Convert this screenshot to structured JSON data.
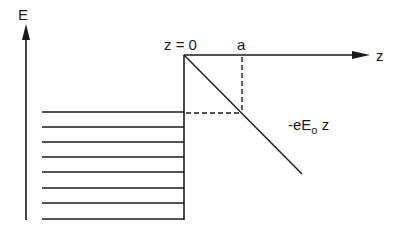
{
  "diagram": {
    "type": "energy-band-diagram",
    "labels": {
      "energy_axis": "E",
      "position_axis": "z",
      "origin": "z = 0",
      "width_marker": "a",
      "potential_prefix": "-eE",
      "potential_subscript": "o",
      "potential_suffix": " z"
    },
    "colors": {
      "line": "#1a1a1a",
      "background": "#ffffff"
    },
    "geometry": {
      "energy_axis": {
        "x": 26,
        "y_top": 24,
        "y_bottom": 220
      },
      "z_axis": {
        "x_start": 184,
        "x_end": 370,
        "y": 55
      },
      "wall": {
        "x": 184,
        "y_top": 55,
        "y_bottom": 220
      },
      "slope_line": {
        "x1": 184,
        "y1": 55,
        "x2": 302,
        "y2": 174
      },
      "dashed_vertical": {
        "x": 242,
        "y1": 55,
        "y2": 113
      },
      "dashed_horizontal": {
        "x1": 184,
        "x2": 242,
        "y": 113
      },
      "filled_levels": {
        "x_start": 42,
        "x_end": 184,
        "y": [
          112,
          127,
          142,
          157,
          172,
          188,
          203,
          219
        ]
      }
    }
  }
}
